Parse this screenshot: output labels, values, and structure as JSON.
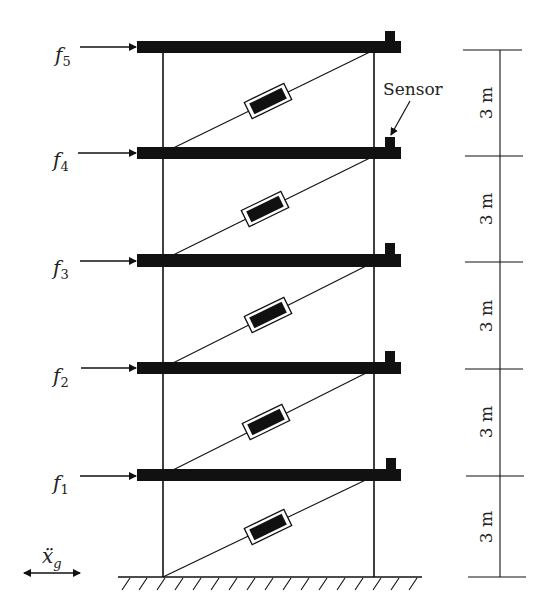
{
  "diagram": {
    "colors": {
      "ink": "#111111",
      "background": "#ffffff"
    },
    "forces": [
      {
        "label": "f",
        "sub": "5"
      },
      {
        "label": "f",
        "sub": "4"
      },
      {
        "label": "f",
        "sub": "3"
      },
      {
        "label": "f",
        "sub": "2"
      },
      {
        "label": "f",
        "sub": "1"
      }
    ],
    "sensor_label": "Sensor",
    "story_heights": [
      "3 m",
      "3 m",
      "3 m",
      "3 m",
      "3 m"
    ],
    "ground_motion": {
      "label": "ẍ",
      "sub": "g"
    },
    "floor_count": 5,
    "damper_count": 5
  }
}
